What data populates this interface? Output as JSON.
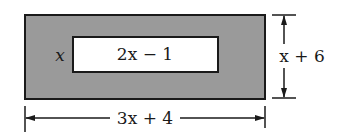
{
  "diagram": {
    "type": "nested-rectangles-dimension-figure",
    "colors": {
      "outer_fill": "#9a9a9a",
      "inner_fill": "#ffffff",
      "stroke": "#1a1a1a",
      "background": "#ffffff"
    },
    "outer_rect": {
      "width_label": "3x + 4",
      "height_label": "x + 6"
    },
    "inner_rect": {
      "width_label": "2x − 1",
      "height_label": "x"
    }
  }
}
